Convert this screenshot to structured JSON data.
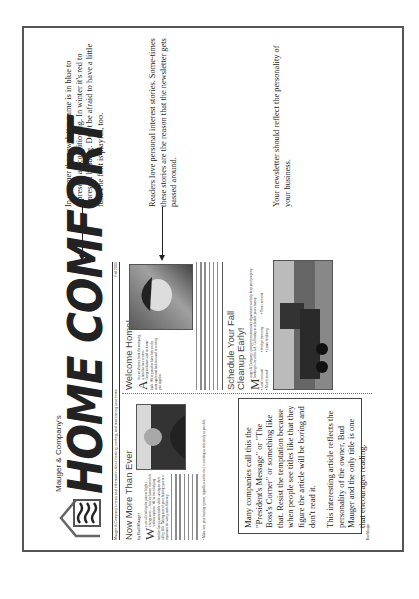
{
  "newsletter": {
    "company": "Mauger & Company's",
    "title": "HOME COMFORT",
    "tagline": "Mauger & Company's news and information about heating, cooling, and maintaining your home",
    "issue": "Fall 2005",
    "article1": {
      "heading": "Now More Than Ever",
      "byline": "by Bud Mauger",
      "dropcap": "W",
      "body": "e are all feeling the pain of higher energy costs — but we haven't been left without options. We've been helping families keep comfortable while saving on their utility bills. Taking care of your heating system is important for safety and efficiency.",
      "bullet_note": "• Make sure your heating system, regardless of the fuel, is running as efficiently as possible."
    },
    "article2": {
      "heading": "Welcome Home!",
      "dropcap": "A",
      "body": "fter an absence from the company, a familiar face returns. Congratulations and welcome back. We're proud to have him on the team again and look forward to serving you together."
    },
    "article3": {
      "heading_line1": "Schedule Your Fall",
      "heading_line2": "Cleanup Early!",
      "dropcap": "M",
      "body": "auger & Company's property maintenance department can help keep your property looking its best this fall. Call today to schedule your cleanup.",
      "bullets": [
        "Leaf removal",
        "Hedge trimming",
        "Tree removal",
        "Mulch install",
        "Lawn fertilizing"
      ]
    },
    "callout_box": {
      "paragraph1": "Many companies call this the \"President's Message\" or \"The Boss's Corner\" or something like that. Resist the temptation because when people see titles like that they figure the article will be boring and don't read it.",
      "paragraph2": "This interesting article reflects the personality of the owner, Bud Mauger and the only title is one that encourages reading."
    },
    "signature": "Bud Mauger"
  },
  "annotations": [
    {
      "text": "In summer the newsletter name is in blue to represent air conditioning.  In winter it's red to represent heading. Don't be afraid to have a little fun.  The font is playful, too."
    },
    {
      "text": "Readers love personal interest stories.  Some-times these stories are the reason that the newsletter gets passed around."
    },
    {
      "text": "Your newsletter should reflect the personality of your business."
    }
  ]
}
